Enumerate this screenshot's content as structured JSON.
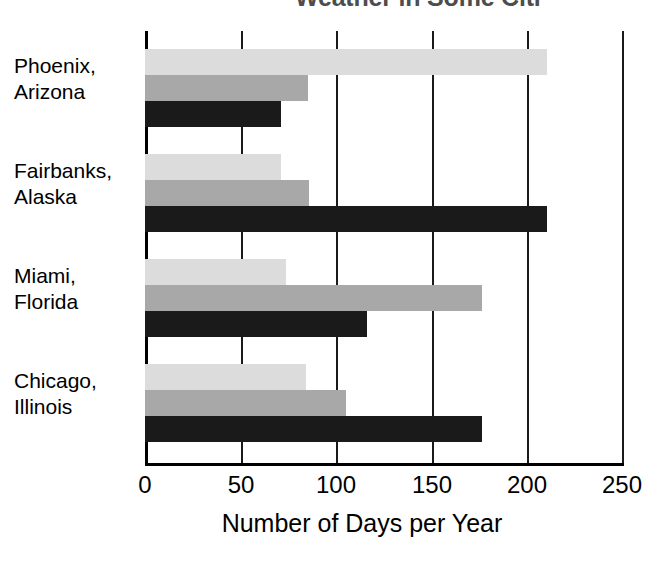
{
  "chart_data": {
    "type": "bar",
    "orientation": "horizontal",
    "title": "Weather in Some Citi",
    "title_note": "cropped at top edge of screenshot",
    "xlabel": "Number of Days per Year",
    "ylabel": "",
    "xlim": [
      0,
      250
    ],
    "xticks": [
      0,
      50,
      100,
      150,
      200,
      250
    ],
    "xtick_labels": [
      "0",
      "50",
      "100",
      "150",
      "200",
      "250"
    ],
    "grid": "vertical",
    "legend": "none",
    "categories": [
      "Phoenix, Arizona",
      "Fairbanks, Alaska",
      "Miami, Florida",
      "Chicago, Illinois"
    ],
    "category_lines": [
      [
        "Phoenix,",
        "Arizona"
      ],
      [
        "Fairbanks,",
        "Alaska"
      ],
      [
        "Miami,",
        "Florida"
      ],
      [
        "Chicago,",
        "Illinois"
      ]
    ],
    "series": [
      {
        "name": "series-1",
        "color": "#dcdcdc",
        "values": [
          210,
          71,
          74,
          84
        ]
      },
      {
        "name": "series-2",
        "color": "#a8a8a8",
        "values": [
          85,
          86,
          176,
          105
        ]
      },
      {
        "name": "series-3",
        "color": "#1a1a1a",
        "values": [
          71,
          210,
          116,
          176
        ]
      }
    ]
  },
  "colors": {
    "series_light": "#dcdcdc",
    "series_medium": "#a8a8a8",
    "series_dark": "#1a1a1a",
    "axis": "#000000",
    "title": "#4d4d4d",
    "background": "#ffffff"
  }
}
